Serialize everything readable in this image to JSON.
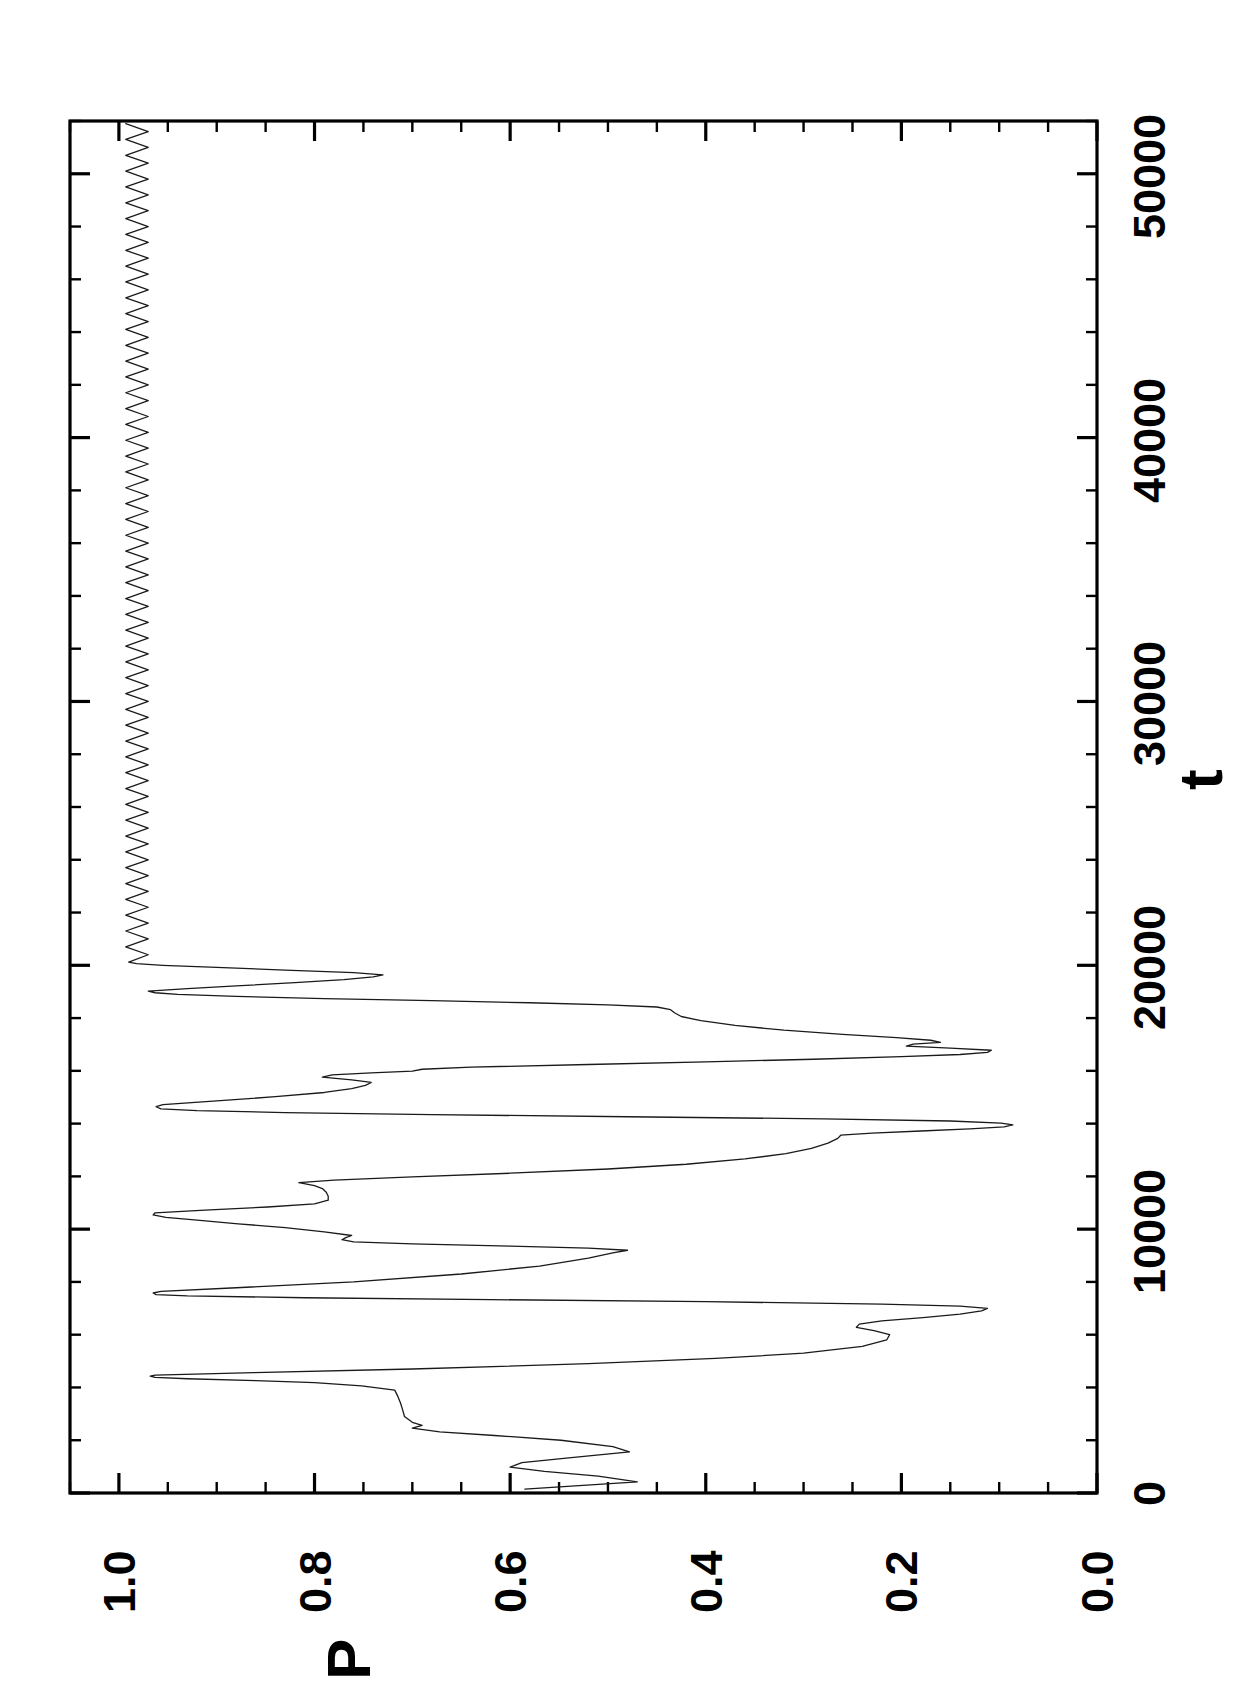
{
  "figure": {
    "orientation": "rotated-90-ccw",
    "background_color": "#ffffff",
    "line_color": "#1a1a1a",
    "axis_color": "#000000"
  },
  "chart_data": {
    "type": "line",
    "title": "",
    "subtitle": "",
    "xlabel": "t",
    "ylabel": "P",
    "xlim": [
      0,
      52000
    ],
    "ylim": [
      0.0,
      1.05
    ],
    "xticks": [
      0,
      10000,
      20000,
      30000,
      40000,
      50000
    ],
    "xtick_labels": [
      "0",
      "10000",
      "20000",
      "30000",
      "40000",
      "50000"
    ],
    "yticks": [
      0.0,
      0.2,
      0.4,
      0.6,
      0.8,
      1.0
    ],
    "ytick_labels": [
      "0.0",
      "0.2",
      "0.4",
      "0.6",
      "0.8",
      "1.0"
    ],
    "x_minor_tick_interval": 2000,
    "y_minor_tick_interval": 0.05,
    "grid": false,
    "legend": null,
    "legend_position": "none",
    "annotations": [],
    "series": [
      {
        "name": "P(t)",
        "color": "#1a1a1a",
        "linewidth": 1.3,
        "description": "Chaotic transient until t~19000, then locks into a small-amplitude period-2 oscillation just below P=1.0",
        "points": [
          [
            150,
            0.585
          ],
          [
            420,
            0.47
          ],
          [
            640,
            0.51
          ],
          [
            820,
            0.565
          ],
          [
            980,
            0.6
          ],
          [
            1150,
            0.588
          ],
          [
            1330,
            0.54
          ],
          [
            1560,
            0.478
          ],
          [
            1760,
            0.495
          ],
          [
            2000,
            0.548
          ],
          [
            2180,
            0.616
          ],
          [
            2320,
            0.672
          ],
          [
            2460,
            0.7
          ],
          [
            2560,
            0.69
          ],
          [
            2680,
            0.7
          ],
          [
            2900,
            0.708
          ],
          [
            3160,
            0.71
          ],
          [
            3400,
            0.712
          ],
          [
            3680,
            0.715
          ],
          [
            3900,
            0.718
          ],
          [
            4060,
            0.752
          ],
          [
            4180,
            0.8
          ],
          [
            4260,
            0.86
          ],
          [
            4330,
            0.93
          ],
          [
            4380,
            0.963
          ],
          [
            4430,
            0.968
          ],
          [
            4470,
            0.963
          ],
          [
            4560,
            0.862
          ],
          [
            4700,
            0.7
          ],
          [
            4900,
            0.52
          ],
          [
            5100,
            0.39
          ],
          [
            5300,
            0.3
          ],
          [
            5560,
            0.24
          ],
          [
            5800,
            0.215
          ],
          [
            6000,
            0.212
          ],
          [
            6150,
            0.228
          ],
          [
            6280,
            0.246
          ],
          [
            6400,
            0.243
          ],
          [
            6520,
            0.22
          ],
          [
            6650,
            0.178
          ],
          [
            6780,
            0.14
          ],
          [
            6900,
            0.118
          ],
          [
            7000,
            0.112
          ],
          [
            7080,
            0.14
          ],
          [
            7160,
            0.22
          ],
          [
            7250,
            0.4
          ],
          [
            7330,
            0.62
          ],
          [
            7400,
            0.81
          ],
          [
            7470,
            0.93
          ],
          [
            7520,
            0.962
          ],
          [
            7580,
            0.965
          ],
          [
            7640,
            0.957
          ],
          [
            7780,
            0.88
          ],
          [
            8000,
            0.76
          ],
          [
            8300,
            0.65
          ],
          [
            8600,
            0.57
          ],
          [
            8900,
            0.52
          ],
          [
            9100,
            0.495
          ],
          [
            9200,
            0.48
          ],
          [
            9280,
            0.52
          ],
          [
            9360,
            0.6
          ],
          [
            9440,
            0.7
          ],
          [
            9520,
            0.76
          ],
          [
            9600,
            0.772
          ],
          [
            9680,
            0.768
          ],
          [
            9760,
            0.762
          ],
          [
            9900,
            0.79
          ],
          [
            10060,
            0.83
          ],
          [
            10200,
            0.878
          ],
          [
            10340,
            0.92
          ],
          [
            10450,
            0.952
          ],
          [
            10540,
            0.965
          ],
          [
            10620,
            0.963
          ],
          [
            10720,
            0.912
          ],
          [
            10840,
            0.848
          ],
          [
            10960,
            0.8
          ],
          [
            11100,
            0.786
          ],
          [
            11250,
            0.786
          ],
          [
            11400,
            0.788
          ],
          [
            11540,
            0.792
          ],
          [
            11650,
            0.8
          ],
          [
            11760,
            0.816
          ],
          [
            11860,
            0.78
          ],
          [
            11980,
            0.7
          ],
          [
            12120,
            0.6
          ],
          [
            12280,
            0.5
          ],
          [
            12460,
            0.42
          ],
          [
            12660,
            0.36
          ],
          [
            12860,
            0.318
          ],
          [
            13060,
            0.292
          ],
          [
            13260,
            0.275
          ],
          [
            13440,
            0.265
          ],
          [
            13560,
            0.262
          ],
          [
            13640,
            0.23
          ],
          [
            13720,
            0.18
          ],
          [
            13800,
            0.13
          ],
          [
            13880,
            0.095
          ],
          [
            13950,
            0.086
          ],
          [
            14020,
            0.098
          ],
          [
            14100,
            0.15
          ],
          [
            14180,
            0.28
          ],
          [
            14260,
            0.48
          ],
          [
            14340,
            0.68
          ],
          [
            14420,
            0.83
          ],
          [
            14490,
            0.92
          ],
          [
            14560,
            0.957
          ],
          [
            14640,
            0.962
          ],
          [
            14720,
            0.955
          ],
          [
            14860,
            0.9
          ],
          [
            15020,
            0.84
          ],
          [
            15180,
            0.79
          ],
          [
            15330,
            0.762
          ],
          [
            15450,
            0.748
          ],
          [
            15560,
            0.742
          ],
          [
            15660,
            0.762
          ],
          [
            15760,
            0.792
          ],
          [
            15850,
            0.782
          ],
          [
            15920,
            0.742
          ],
          [
            15990,
            0.7
          ],
          [
            16060,
            0.69
          ],
          [
            16140,
            0.64
          ],
          [
            16240,
            0.52
          ],
          [
            16340,
            0.4
          ],
          [
            16440,
            0.29
          ],
          [
            16540,
            0.2
          ],
          [
            16620,
            0.14
          ],
          [
            16700,
            0.112
          ],
          [
            16780,
            0.108
          ],
          [
            16860,
            0.15
          ],
          [
            16940,
            0.195
          ],
          [
            17010,
            0.188
          ],
          [
            17080,
            0.16
          ],
          [
            17160,
            0.17
          ],
          [
            17260,
            0.205
          ],
          [
            17380,
            0.26
          ],
          [
            17540,
            0.32
          ],
          [
            17720,
            0.37
          ],
          [
            17900,
            0.405
          ],
          [
            18060,
            0.425
          ],
          [
            18200,
            0.432
          ],
          [
            18320,
            0.436
          ],
          [
            18420,
            0.45
          ],
          [
            18500,
            0.5
          ],
          [
            18580,
            0.58
          ],
          [
            18660,
            0.68
          ],
          [
            18740,
            0.79
          ],
          [
            18820,
            0.88
          ],
          [
            18900,
            0.94
          ],
          [
            18960,
            0.963
          ],
          [
            19020,
            0.97
          ],
          [
            19120,
            0.93
          ],
          [
            19220,
            0.88
          ],
          [
            19340,
            0.82
          ],
          [
            19460,
            0.77
          ],
          [
            19560,
            0.74
          ],
          [
            19640,
            0.73
          ],
          [
            19720,
            0.76
          ],
          [
            19820,
            0.83
          ],
          [
            19920,
            0.9
          ],
          [
            20000,
            0.955
          ],
          [
            20060,
            0.982
          ],
          [
            20120,
            0.99
          ],
          [
            20400,
            0.97
          ],
          [
            20700,
            0.993
          ],
          [
            21000,
            0.97
          ],
          [
            21300,
            0.993
          ],
          [
            21600,
            0.97
          ],
          [
            21900,
            0.993
          ],
          [
            22200,
            0.97
          ],
          [
            22500,
            0.993
          ],
          [
            22800,
            0.97
          ],
          [
            23100,
            0.993
          ],
          [
            23400,
            0.97
          ],
          [
            23700,
            0.993
          ],
          [
            24000,
            0.97
          ],
          [
            24300,
            0.993
          ],
          [
            24600,
            0.97
          ],
          [
            24900,
            0.993
          ],
          [
            25200,
            0.97
          ],
          [
            25500,
            0.993
          ],
          [
            25800,
            0.97
          ],
          [
            26100,
            0.993
          ],
          [
            26400,
            0.97
          ],
          [
            26700,
            0.993
          ],
          [
            27000,
            0.97
          ],
          [
            27300,
            0.993
          ],
          [
            27600,
            0.97
          ],
          [
            27900,
            0.993
          ],
          [
            28200,
            0.97
          ],
          [
            28500,
            0.993
          ],
          [
            28800,
            0.97
          ],
          [
            29100,
            0.993
          ],
          [
            29400,
            0.97
          ],
          [
            29700,
            0.993
          ],
          [
            30000,
            0.97
          ],
          [
            30300,
            0.993
          ],
          [
            30600,
            0.97
          ],
          [
            30900,
            0.993
          ],
          [
            31200,
            0.97
          ],
          [
            31500,
            0.993
          ],
          [
            31800,
            0.97
          ],
          [
            32100,
            0.993
          ],
          [
            32400,
            0.97
          ],
          [
            32700,
            0.993
          ],
          [
            33000,
            0.97
          ],
          [
            33300,
            0.993
          ],
          [
            33600,
            0.97
          ],
          [
            33900,
            0.993
          ],
          [
            34200,
            0.97
          ],
          [
            34500,
            0.993
          ],
          [
            34800,
            0.97
          ],
          [
            35100,
            0.993
          ],
          [
            35400,
            0.97
          ],
          [
            35700,
            0.993
          ],
          [
            36000,
            0.97
          ],
          [
            36300,
            0.993
          ],
          [
            36600,
            0.97
          ],
          [
            36900,
            0.993
          ],
          [
            37200,
            0.97
          ],
          [
            37500,
            0.993
          ],
          [
            37800,
            0.97
          ],
          [
            38100,
            0.993
          ],
          [
            38400,
            0.97
          ],
          [
            38700,
            0.993
          ],
          [
            39000,
            0.97
          ],
          [
            39300,
            0.993
          ],
          [
            39600,
            0.97
          ],
          [
            39900,
            0.993
          ],
          [
            40200,
            0.97
          ],
          [
            40500,
            0.993
          ],
          [
            40800,
            0.97
          ],
          [
            41100,
            0.993
          ],
          [
            41400,
            0.97
          ],
          [
            41700,
            0.993
          ],
          [
            42000,
            0.97
          ],
          [
            42300,
            0.993
          ],
          [
            42600,
            0.97
          ],
          [
            42900,
            0.993
          ],
          [
            43200,
            0.97
          ],
          [
            43500,
            0.993
          ],
          [
            43800,
            0.97
          ],
          [
            44100,
            0.993
          ],
          [
            44400,
            0.97
          ],
          [
            44700,
            0.993
          ],
          [
            45000,
            0.97
          ],
          [
            45300,
            0.993
          ],
          [
            45600,
            0.97
          ],
          [
            45900,
            0.993
          ],
          [
            46200,
            0.97
          ],
          [
            46500,
            0.993
          ],
          [
            46800,
            0.97
          ],
          [
            47100,
            0.993
          ],
          [
            47400,
            0.97
          ],
          [
            47700,
            0.993
          ],
          [
            48000,
            0.97
          ],
          [
            48300,
            0.993
          ],
          [
            48600,
            0.97
          ],
          [
            48900,
            0.993
          ],
          [
            49200,
            0.97
          ],
          [
            49500,
            0.993
          ],
          [
            49800,
            0.97
          ],
          [
            50100,
            0.993
          ],
          [
            50400,
            0.97
          ],
          [
            50700,
            0.993
          ],
          [
            51000,
            0.97
          ],
          [
            51300,
            0.993
          ],
          [
            51600,
            0.97
          ],
          [
            51900,
            0.993
          ]
        ]
      }
    ]
  }
}
